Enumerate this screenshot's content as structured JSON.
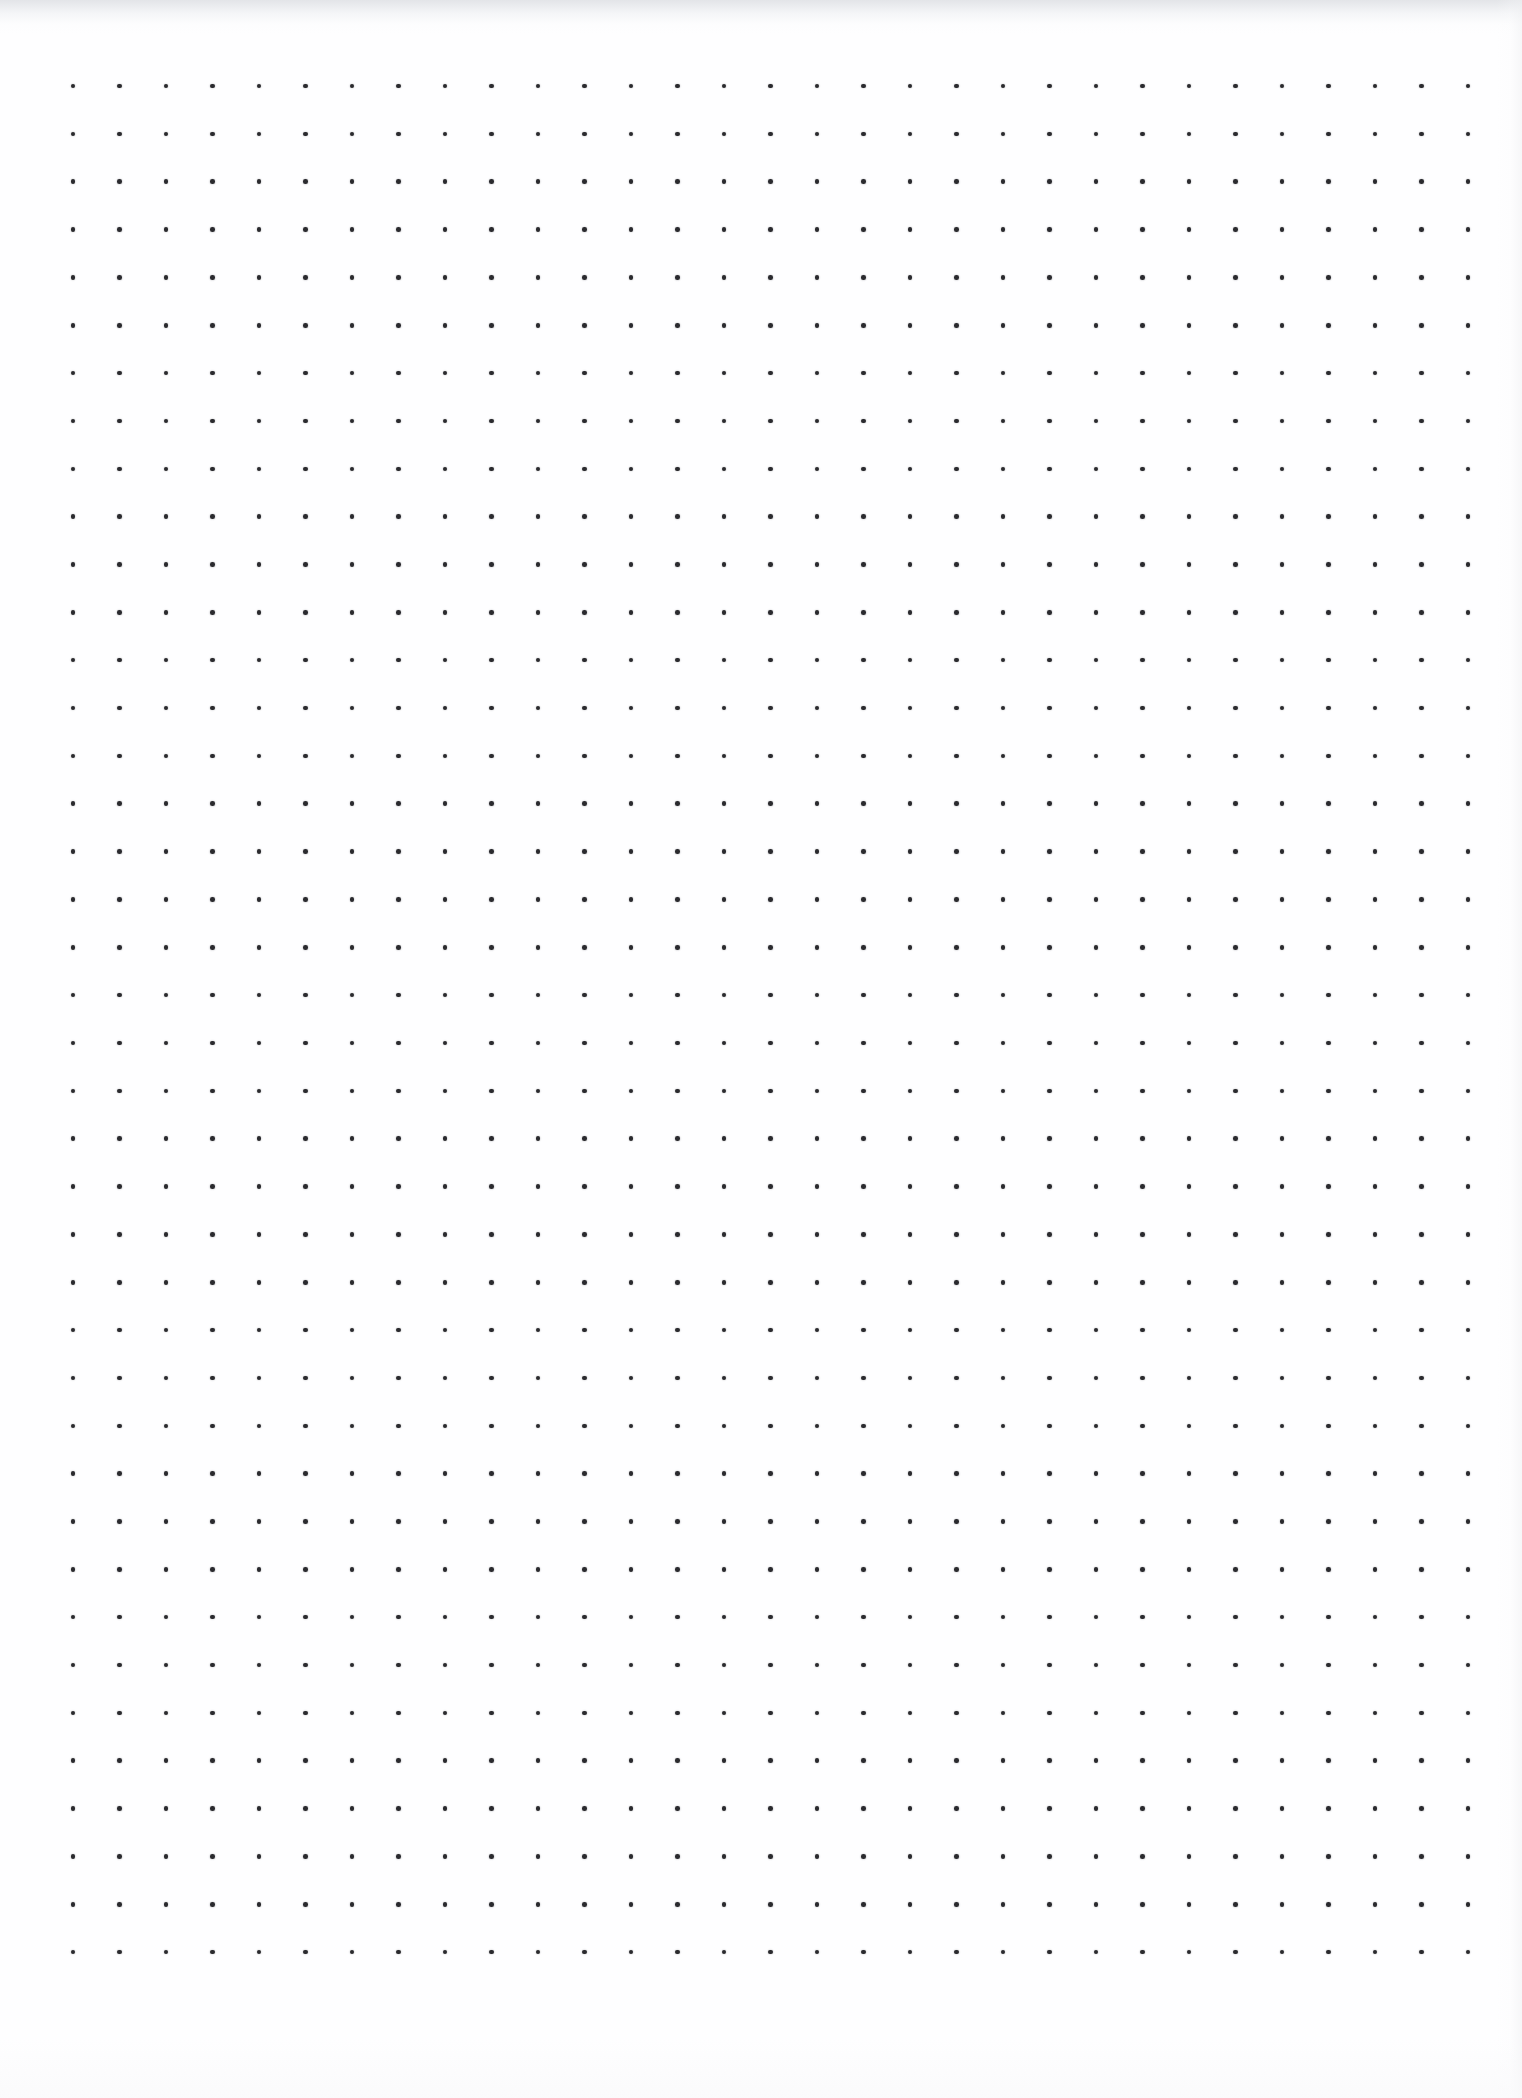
{
  "document": {
    "title": "Dot Grid Paper",
    "type": "dot-grid-notebook-page",
    "state": "blank",
    "content_text": "",
    "notes_count": 0
  },
  "canvas": {
    "width": 1522,
    "height": 2098,
    "background_color": "#fefeff",
    "paper_color": "#ffffff"
  },
  "grid": {
    "label": "dot-grid",
    "columns": 31,
    "rows": 40,
    "origin_x": 73,
    "origin_y": 86,
    "spacing_x": 46.5,
    "spacing_y": 47.85,
    "dot_diameter": 4.6,
    "dot_color": "#2a2a2e",
    "last_column_x": 1468,
    "last_row_y": 1951,
    "margin_left": 73,
    "margin_top": 86,
    "margin_right": 54,
    "margin_bottom": 147
  },
  "scan_artifacts": {
    "top_shadow_color": "#dee0e4",
    "top_shadow_height": 34,
    "right_shadow_color": "#f0f1f3",
    "right_shadow_width": 26,
    "bottom_shadow_color": "#f9f9fa",
    "bottom_shadow_height": 60
  }
}
